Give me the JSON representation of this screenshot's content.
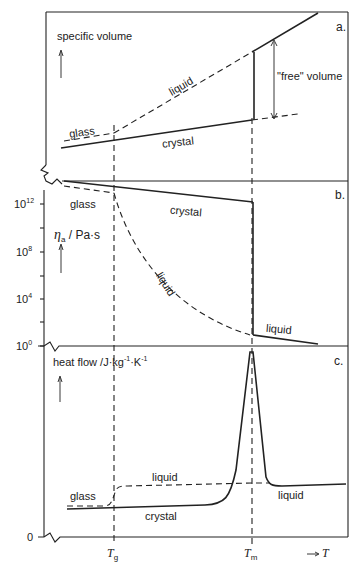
{
  "figure": {
    "panels": [
      {
        "id": "a",
        "tag": "a.",
        "ylabel": "specific volume",
        "labels": {
          "liquid": "liquid",
          "glass": "glass",
          "crystal": "crystal",
          "free_volume": "\"free\" volume"
        }
      },
      {
        "id": "b",
        "tag": "b.",
        "ylabel_symbol": "η",
        "ylabel_sub": "a",
        "ylabel_unit": " / Pa·s",
        "yticks": [
          {
            "base": "10",
            "exp": "12"
          },
          {
            "base": "10",
            "exp": "8"
          },
          {
            "base": "10",
            "exp": "4"
          },
          {
            "base": "10",
            "exp": "0"
          }
        ],
        "labels": {
          "glass": "glass",
          "crystal": "crystal",
          "liquid_curve": "liquid",
          "liquid_high": "liquid"
        }
      },
      {
        "id": "c",
        "tag": "c.",
        "ylabel": "heat flow /J·kg",
        "ylabel_exp1": "-1",
        "ylabel_mid": "·K",
        "ylabel_exp2": "-1",
        "y_zero": "0",
        "labels": {
          "liquid_dashed": "liquid",
          "glass": "glass",
          "crystal": "crystal",
          "liquid_high": "liquid"
        }
      }
    ],
    "xaxis": {
      "tg": "T",
      "tg_sub": "g",
      "tm": "T",
      "tm_sub": "m",
      "arrow": "→",
      "xlabel": "T"
    }
  }
}
